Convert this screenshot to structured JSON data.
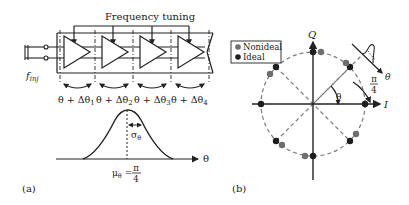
{
  "panel_a": {
    "label": "(a)",
    "top_label": "Frequency tuning",
    "input_label_f": "f",
    "input_label_sub": "inj",
    "stage_count": 4,
    "stages": [
      {
        "theta": "θ + Δθ",
        "sub": "1"
      },
      {
        "theta": "θ + Δθ",
        "sub": "2"
      },
      {
        "theta": "θ + Δθ",
        "sub": "3"
      },
      {
        "theta": "θ + Δθ",
        "sub": "4"
      }
    ],
    "distribution": {
      "type": "gaussian",
      "x_axis_label": "θ",
      "sigma_label": "σ",
      "sigma_sub": "θ",
      "mean_label": "μ",
      "mean_sub": "θ",
      "mean_eq": " = ",
      "mean_num": "π",
      "mean_den": "4"
    }
  },
  "panel_b": {
    "label": "(b)",
    "axis_x": "I",
    "axis_y": "Q",
    "angle_label": "θ",
    "angle_step_num": "π",
    "angle_step_den": "4",
    "inset_axis_label": "θ",
    "legend": [
      {
        "label": "Nonideal",
        "color": "#6e6e6e"
      },
      {
        "label": "Ideal",
        "color": "#1e1e1e"
      }
    ],
    "ideal_points_deg": [
      0,
      45,
      90,
      135,
      180,
      225,
      270,
      315
    ],
    "nonideal_points_deg": [
      20,
      52,
      78,
      125,
      150,
      210,
      232,
      282,
      332
    ]
  },
  "colors": {
    "line": "#222222",
    "dashed": "#7a7a7a",
    "ideal": "#1e1e1e",
    "nonideal": "#6e6e6e"
  }
}
